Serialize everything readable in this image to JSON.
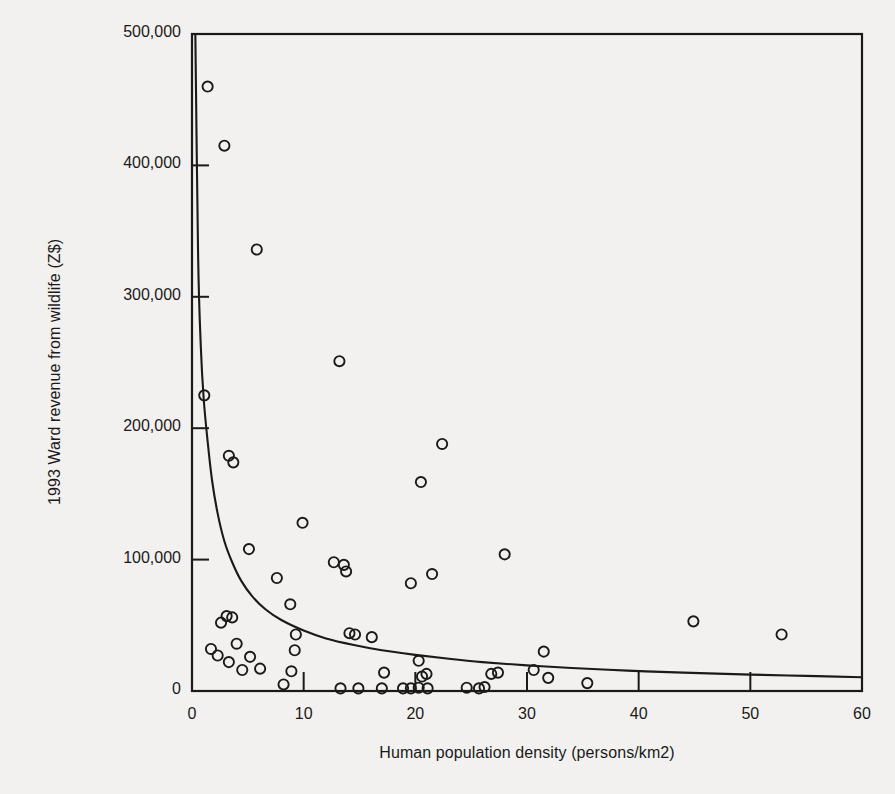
{
  "chart_data": {
    "type": "scatter",
    "title": "",
    "xlabel": "Human population density (persons/km2)",
    "ylabel": "1993 Ward revenue from wildlife (Z$)",
    "xlim": [
      0,
      60
    ],
    "ylim": [
      0,
      500000
    ],
    "xticks": [
      0,
      10,
      20,
      30,
      40,
      50,
      60
    ],
    "xtick_labels": [
      "0",
      "10",
      "20",
      "30",
      "40",
      "50",
      "60"
    ],
    "yticks": [
      0,
      100000,
      200000,
      300000,
      400000,
      500000
    ],
    "ytick_labels": [
      "0",
      "100,000",
      "200,000",
      "300,000",
      "400,000",
      "500,000"
    ],
    "grid": false,
    "legend": null,
    "marker": "open-circle",
    "marker_color": "#1a1a1a",
    "marker_fill": "none",
    "points": [
      {
        "x": 1.4,
        "y": 460000
      },
      {
        "x": 2.9,
        "y": 415000
      },
      {
        "x": 5.8,
        "y": 336000
      },
      {
        "x": 13.2,
        "y": 251000
      },
      {
        "x": 1.1,
        "y": 225000
      },
      {
        "x": 3.3,
        "y": 179000
      },
      {
        "x": 3.7,
        "y": 174000
      },
      {
        "x": 22.4,
        "y": 188000
      },
      {
        "x": 20.5,
        "y": 159000
      },
      {
        "x": 9.9,
        "y": 128000
      },
      {
        "x": 5.1,
        "y": 108000
      },
      {
        "x": 28.0,
        "y": 104000
      },
      {
        "x": 12.7,
        "y": 98000
      },
      {
        "x": 13.6,
        "y": 96000
      },
      {
        "x": 13.8,
        "y": 91000
      },
      {
        "x": 7.6,
        "y": 86000
      },
      {
        "x": 21.5,
        "y": 89000
      },
      {
        "x": 19.6,
        "y": 82000
      },
      {
        "x": 8.8,
        "y": 66000
      },
      {
        "x": 3.1,
        "y": 57000
      },
      {
        "x": 3.6,
        "y": 56000
      },
      {
        "x": 2.6,
        "y": 52000
      },
      {
        "x": 44.9,
        "y": 53000
      },
      {
        "x": 52.8,
        "y": 43000
      },
      {
        "x": 9.3,
        "y": 43000
      },
      {
        "x": 14.1,
        "y": 44000
      },
      {
        "x": 14.6,
        "y": 43000
      },
      {
        "x": 16.1,
        "y": 41000
      },
      {
        "x": 4.0,
        "y": 36000
      },
      {
        "x": 1.7,
        "y": 32000
      },
      {
        "x": 9.2,
        "y": 31000
      },
      {
        "x": 31.5,
        "y": 30000
      },
      {
        "x": 2.3,
        "y": 27000
      },
      {
        "x": 5.2,
        "y": 26000
      },
      {
        "x": 20.3,
        "y": 23000
      },
      {
        "x": 3.3,
        "y": 22000
      },
      {
        "x": 17.2,
        "y": 14000
      },
      {
        "x": 8.9,
        "y": 15000
      },
      {
        "x": 4.5,
        "y": 16000
      },
      {
        "x": 6.1,
        "y": 17000
      },
      {
        "x": 21.0,
        "y": 13000
      },
      {
        "x": 20.6,
        "y": 11000
      },
      {
        "x": 26.8,
        "y": 13000
      },
      {
        "x": 27.4,
        "y": 14000
      },
      {
        "x": 30.6,
        "y": 16000
      },
      {
        "x": 31.9,
        "y": 10000
      },
      {
        "x": 35.4,
        "y": 6000
      },
      {
        "x": 13.3,
        "y": 2000
      },
      {
        "x": 14.9,
        "y": 2000
      },
      {
        "x": 17.0,
        "y": 2000
      },
      {
        "x": 18.9,
        "y": 2000
      },
      {
        "x": 19.6,
        "y": 2000
      },
      {
        "x": 20.3,
        "y": 2500
      },
      {
        "x": 21.1,
        "y": 2000
      },
      {
        "x": 24.6,
        "y": 2500
      },
      {
        "x": 25.7,
        "y": 2000
      },
      {
        "x": 26.2,
        "y": 3000
      },
      {
        "x": 8.2,
        "y": 5000
      }
    ],
    "fit_curve": {
      "kind": "inverse-power",
      "description": "decaying fitted curve y = a / x^b",
      "a": 78000,
      "b": 0.72,
      "color": "#1a1a1a",
      "points": [
        {
          "x": 0.3,
          "y": 500000
        },
        {
          "x": 0.55,
          "y": 330000
        },
        {
          "x": 0.8,
          "y": 260000
        },
        {
          "x": 1.05,
          "y": 222000
        },
        {
          "x": 1.4,
          "y": 190000
        },
        {
          "x": 1.8,
          "y": 160000
        },
        {
          "x": 2.3,
          "y": 135000
        },
        {
          "x": 2.9,
          "y": 114000
        },
        {
          "x": 3.6,
          "y": 98000
        },
        {
          "x": 4.4,
          "y": 84000
        },
        {
          "x": 5.4,
          "y": 72000
        },
        {
          "x": 6.6,
          "y": 62000
        },
        {
          "x": 8.0,
          "y": 54000
        },
        {
          "x": 10.0,
          "y": 46000
        },
        {
          "x": 12.0,
          "y": 40000
        },
        {
          "x": 14.5,
          "y": 35000
        },
        {
          "x": 17.0,
          "y": 31000
        },
        {
          "x": 20.0,
          "y": 27500
        },
        {
          "x": 23.0,
          "y": 24500
        },
        {
          "x": 26.0,
          "y": 22000
        },
        {
          "x": 30.0,
          "y": 19500
        },
        {
          "x": 34.0,
          "y": 17500
        },
        {
          "x": 39.0,
          "y": 15500
        },
        {
          "x": 44.0,
          "y": 14000
        },
        {
          "x": 50.0,
          "y": 12500
        },
        {
          "x": 55.0,
          "y": 11500
        },
        {
          "x": 60.0,
          "y": 10500
        }
      ]
    }
  }
}
